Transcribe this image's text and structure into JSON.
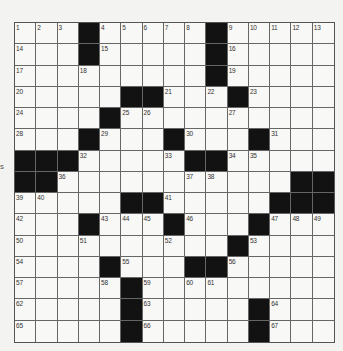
{
  "puzzle": {
    "rows": 15,
    "cols": 15,
    "layout": [
      "1 2 3 # 4 5 6 7 8 # 9 10 11 12 13",
      "14 . . # 15 . . . . # 16 . . . .",
      "17 . . 18 . . . . . # 19 . . . .",
      "20 . . . . # # 21 . 22 # 23 . . .",
      "24 . . . # 25 26 . . . 27 . . . .",
      "28 . . # 29 . . # 30 . . # 31 . .",
      "# # # 32 . . . 33 # # 34 35 . . .",
      "# # 36 . . . . . 37 38 . . . # #",
      "39 40 . . . # # 41 . . . . # # #",
      "42 . . # 43 44 45 # 46 . . # 47 48 49",
      "50 . . 51 . . . 52 . . # 53 . . .",
      "54 . . . # 55 . . # # 56 . . . .",
      "57 . . . 58 # 59 . 60 61 . . . . .",
      "62 . . . . # 63 . . . . # 64 . .",
      "65 . . . . # 66 . . . . # 67 . ."
    ],
    "cells": []
  },
  "edge_fragment": "s",
  "colors": {
    "background": "#f3f3f1",
    "cell": "#f8f8f6",
    "block": "#121212",
    "grid_line": "#666666",
    "number": "#333333"
  }
}
